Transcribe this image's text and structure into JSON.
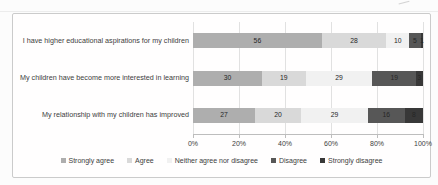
{
  "chart_data": {
    "type": "bar",
    "orientation": "horizontal-stacked",
    "categories": [
      "I have higher educational aspirations for my children",
      "My children have become more interested in learning",
      "My relationship with my children has improved"
    ],
    "series": [
      {
        "name": "Strongly agree",
        "color": "#aeaeae",
        "values": [
          56,
          30,
          27
        ]
      },
      {
        "name": "Agree",
        "color": "#d9d9d9",
        "values": [
          28,
          19,
          20
        ]
      },
      {
        "name": "Neither agree nor disagree",
        "color": "#f1f1f1",
        "values": [
          10,
          29,
          29
        ]
      },
      {
        "name": "Disagree",
        "color": "#575757",
        "values": [
          5,
          19,
          16
        ]
      },
      {
        "name": "Strongly disagree",
        "color": "#383838",
        "values": [
          1,
          3,
          8
        ]
      }
    ],
    "xlim": [
      0,
      100
    ],
    "xticks": [
      "0%",
      "20%",
      "40%",
      "60%",
      "80%",
      "100%"
    ],
    "xtick_values": [
      0,
      20,
      40,
      60,
      80,
      100
    ],
    "grid": "vertical",
    "legend_position": "bottom",
    "title": "",
    "xlabel": "",
    "ylabel": ""
  }
}
